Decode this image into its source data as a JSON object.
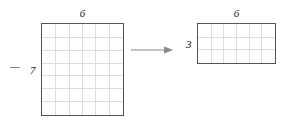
{
  "diagram": {
    "background_color": "#ffffff",
    "border_color": "#555555",
    "grid_color": "#dddddd",
    "label_color": "#222222",
    "arrow_color": "#888888"
  },
  "shapes": [
    {
      "id": "source-rectangle",
      "name": "large-square",
      "top_label": "6",
      "left_label": "7",
      "cols": 6,
      "rows": 7,
      "x": 41,
      "y": 23,
      "width": 83,
      "height": 93
    },
    {
      "id": "result-rectangle",
      "name": "small-rectangle",
      "top_label": "6",
      "left_label": "3",
      "cols": 6,
      "rows": 3,
      "x": 197,
      "y": 23,
      "width": 79,
      "height": 41
    }
  ],
  "arrow": {
    "name": "transformation-arrow",
    "label": "",
    "x": 131,
    "y": 45,
    "length": 42
  },
  "tick_dash": {
    "name": "left-dash-mark",
    "x": 10,
    "y": 67,
    "width": 10
  },
  "chart_data": {
    "type": "diagram",
    "shapes": [
      {
        "label": "source",
        "width_units": 6,
        "height_units": 7,
        "area": 42
      },
      {
        "label": "result",
        "width_units": 6,
        "height_units": 3,
        "area": 18
      }
    ],
    "relation": "arrow from source to result"
  }
}
